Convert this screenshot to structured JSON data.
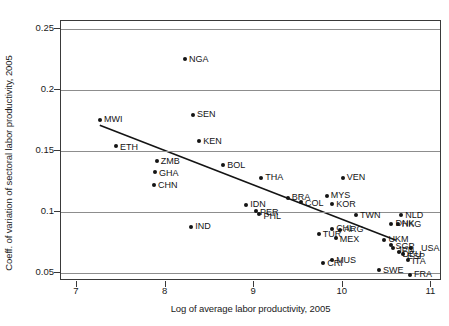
{
  "chart_data": {
    "type": "scatter",
    "title": "",
    "xlabel": "Log of average labor productivity, 2005",
    "ylabel": "Coeff. of variation of sectoral labor productivity, 2005",
    "xlim": [
      6.82,
      11.12
    ],
    "ylim": [
      0.0435,
      0.2565
    ],
    "xticks": [
      7,
      8,
      9,
      10,
      11
    ],
    "xtick_labels": [
      "7",
      "8",
      "9",
      "10",
      "11"
    ],
    "yticks": [
      0.05,
      0.1,
      0.15,
      0.2,
      0.25
    ],
    "ytick_labels": [
      "0.05",
      "0.1",
      "0.15",
      "0.2",
      "0.25"
    ],
    "grid": "horizontal",
    "legend": null,
    "marker_color": "#141414",
    "line_color": "#141414",
    "fit_line": {
      "label": "linear fit",
      "x": [
        7.26,
        10.62
      ],
      "y": [
        0.1705,
        0.0755
      ]
    },
    "points": [
      {
        "label": "MWI",
        "x": 7.26,
        "y": 0.1755,
        "lx": 4,
        "ly": 0
      },
      {
        "label": "ETH",
        "x": 7.44,
        "y": 0.154,
        "lx": 4,
        "ly": 1
      },
      {
        "label": "ZMB",
        "x": 7.9,
        "y": 0.142,
        "lx": 4,
        "ly": 1
      },
      {
        "label": "GHA",
        "x": 7.88,
        "y": 0.1325,
        "lx": 4,
        "ly": 1
      },
      {
        "label": "CHN",
        "x": 7.87,
        "y": 0.1225,
        "lx": 4,
        "ly": 1
      },
      {
        "label": "NGA",
        "x": 8.22,
        "y": 0.225,
        "lx": 4,
        "ly": 0
      },
      {
        "label": "SEN",
        "x": 8.31,
        "y": 0.1795,
        "lx": 4,
        "ly": 0
      },
      {
        "label": "KEN",
        "x": 8.38,
        "y": 0.1578,
        "lx": 4,
        "ly": 0
      },
      {
        "label": "BOL",
        "x": 8.65,
        "y": 0.1385,
        "lx": 4,
        "ly": 0
      },
      {
        "label": "IND",
        "x": 8.29,
        "y": 0.088,
        "lx": 4,
        "ly": 0
      },
      {
        "label": "THA",
        "x": 9.08,
        "y": 0.1282,
        "lx": 4,
        "ly": 0
      },
      {
        "label": "IDN",
        "x": 8.91,
        "y": 0.1058,
        "lx": 4,
        "ly": 0
      },
      {
        "label": "PER",
        "x": 9.02,
        "y": 0.1008,
        "lx": 4,
        "ly": 1
      },
      {
        "label": "PHL",
        "x": 9.06,
        "y": 0.0982,
        "lx": 4,
        "ly": 2
      },
      {
        "label": "BRA",
        "x": 9.38,
        "y": 0.1118,
        "lx": 4,
        "ly": 0
      },
      {
        "label": "COL",
        "x": 9.53,
        "y": 0.1085,
        "lx": 4,
        "ly": 2
      },
      {
        "label": "MYS",
        "x": 9.82,
        "y": 0.1135,
        "lx": 4,
        "ly": 0
      },
      {
        "label": "KOR",
        "x": 9.88,
        "y": 0.1062,
        "lx": 4,
        "ly": 0
      },
      {
        "label": "VEN",
        "x": 10.0,
        "y": 0.1282,
        "lx": 4,
        "ly": 0
      },
      {
        "label": "TWN",
        "x": 10.15,
        "y": 0.0972,
        "lx": 4,
        "ly": 0
      },
      {
        "label": "NLD",
        "x": 10.66,
        "y": 0.0972,
        "lx": 4,
        "ly": 0
      },
      {
        "label": "DNK",
        "x": 10.55,
        "y": 0.0905,
        "lx": 4,
        "ly": 0
      },
      {
        "label": "HKG",
        "x": 10.62,
        "y": 0.09,
        "lx": 4,
        "ly": 0
      },
      {
        "label": "CHL",
        "x": 9.88,
        "y": 0.0862,
        "lx": 4,
        "ly": 0
      },
      {
        "label": "ARG",
        "x": 9.97,
        "y": 0.0855,
        "lx": 4,
        "ly": 0
      },
      {
        "label": "TUR",
        "x": 9.73,
        "y": 0.0818,
        "lx": 4,
        "ly": 0
      },
      {
        "label": "MEX",
        "x": 9.92,
        "y": 0.0788,
        "lx": 4,
        "ly": 2
      },
      {
        "label": "UKM",
        "x": 10.47,
        "y": 0.0772,
        "lx": 4,
        "ly": 0
      },
      {
        "label": "SGP",
        "x": 10.55,
        "y": 0.0728,
        "lx": 4,
        "ly": 1
      },
      {
        "label": "USA",
        "x": 10.77,
        "y": 0.0702,
        "lx": 10,
        "ly": 0
      },
      {
        "label": "JPN",
        "x": 10.57,
        "y": 0.0702,
        "lx": 4,
        "ly": 2
      },
      {
        "label": "DEU",
        "x": 10.63,
        "y": 0.0672,
        "lx": 4,
        "ly": 2
      },
      {
        "label": "ESP",
        "x": 10.68,
        "y": 0.0655,
        "lx": 4,
        "ly": 2
      },
      {
        "label": "ITA",
        "x": 10.74,
        "y": 0.0605,
        "lx": 4,
        "ly": 1
      },
      {
        "label": "CRI",
        "x": 9.78,
        "y": 0.0582,
        "lx": 4,
        "ly": 0
      },
      {
        "label": "MUS",
        "x": 9.88,
        "y": 0.0605,
        "lx": 4,
        "ly": 0
      },
      {
        "label": "SWE",
        "x": 10.41,
        "y": 0.0522,
        "lx": 4,
        "ly": 0
      },
      {
        "label": "FRA",
        "x": 10.76,
        "y": 0.0488,
        "lx": 4,
        "ly": 0
      }
    ]
  }
}
